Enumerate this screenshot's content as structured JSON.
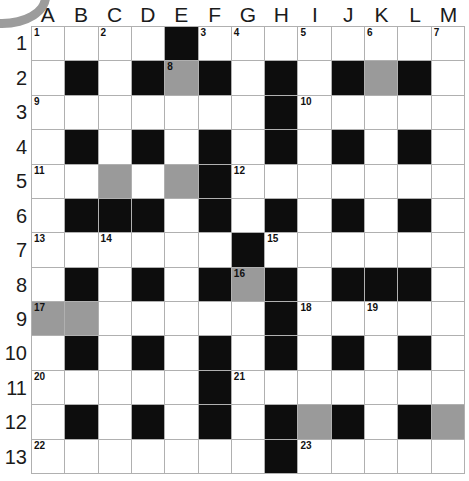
{
  "puzzle": {
    "title": "Crossword Grid",
    "columns": 13,
    "rows": 13,
    "column_headers": [
      "A",
      "B",
      "C",
      "D",
      "E",
      "F",
      "G",
      "H",
      "I",
      "J",
      "K",
      "L",
      "M"
    ],
    "row_headers": [
      "1",
      "2",
      "3",
      "4",
      "5",
      "6",
      "7",
      "8",
      "9",
      "10",
      "11",
      "12",
      "13"
    ],
    "colors": {
      "white_cell": "#ffffff",
      "black_cell": "#0d0d0d",
      "gray_cell": "#9a9a9a",
      "grid_line": "#b0b0b0",
      "text": "#1b1b1b",
      "corner_arc": "#9c9c9c"
    },
    "legend": {
      "white": "open answer cell",
      "black": "blocked cell",
      "gray": "highlighted answer cell"
    },
    "clue_number_count": 23,
    "cells": [
      [
        {
          "state": "white",
          "num": "1"
        },
        {
          "state": "white",
          "num": ""
        },
        {
          "state": "white",
          "num": "2"
        },
        {
          "state": "white",
          "num": ""
        },
        {
          "state": "black",
          "num": ""
        },
        {
          "state": "white",
          "num": "3"
        },
        {
          "state": "white",
          "num": "4"
        },
        {
          "state": "white",
          "num": ""
        },
        {
          "state": "white",
          "num": "5"
        },
        {
          "state": "white",
          "num": ""
        },
        {
          "state": "white",
          "num": "6"
        },
        {
          "state": "white",
          "num": ""
        },
        {
          "state": "white",
          "num": "7"
        }
      ],
      [
        {
          "state": "white",
          "num": ""
        },
        {
          "state": "black",
          "num": ""
        },
        {
          "state": "white",
          "num": ""
        },
        {
          "state": "black",
          "num": ""
        },
        {
          "state": "gray",
          "num": "8"
        },
        {
          "state": "black",
          "num": ""
        },
        {
          "state": "white",
          "num": ""
        },
        {
          "state": "black",
          "num": ""
        },
        {
          "state": "white",
          "num": ""
        },
        {
          "state": "black",
          "num": ""
        },
        {
          "state": "gray",
          "num": ""
        },
        {
          "state": "black",
          "num": ""
        },
        {
          "state": "white",
          "num": ""
        }
      ],
      [
        {
          "state": "white",
          "num": "9"
        },
        {
          "state": "white",
          "num": ""
        },
        {
          "state": "white",
          "num": ""
        },
        {
          "state": "white",
          "num": ""
        },
        {
          "state": "white",
          "num": ""
        },
        {
          "state": "white",
          "num": ""
        },
        {
          "state": "white",
          "num": ""
        },
        {
          "state": "black",
          "num": ""
        },
        {
          "state": "white",
          "num": "10"
        },
        {
          "state": "white",
          "num": ""
        },
        {
          "state": "white",
          "num": ""
        },
        {
          "state": "white",
          "num": ""
        },
        {
          "state": "white",
          "num": ""
        }
      ],
      [
        {
          "state": "white",
          "num": ""
        },
        {
          "state": "black",
          "num": ""
        },
        {
          "state": "white",
          "num": ""
        },
        {
          "state": "black",
          "num": ""
        },
        {
          "state": "white",
          "num": ""
        },
        {
          "state": "black",
          "num": ""
        },
        {
          "state": "white",
          "num": ""
        },
        {
          "state": "black",
          "num": ""
        },
        {
          "state": "white",
          "num": ""
        },
        {
          "state": "black",
          "num": ""
        },
        {
          "state": "white",
          "num": ""
        },
        {
          "state": "black",
          "num": ""
        },
        {
          "state": "white",
          "num": ""
        }
      ],
      [
        {
          "state": "white",
          "num": "11"
        },
        {
          "state": "white",
          "num": ""
        },
        {
          "state": "gray",
          "num": ""
        },
        {
          "state": "white",
          "num": ""
        },
        {
          "state": "gray",
          "num": ""
        },
        {
          "state": "black",
          "num": ""
        },
        {
          "state": "white",
          "num": "12"
        },
        {
          "state": "white",
          "num": ""
        },
        {
          "state": "white",
          "num": ""
        },
        {
          "state": "white",
          "num": ""
        },
        {
          "state": "white",
          "num": ""
        },
        {
          "state": "white",
          "num": ""
        },
        {
          "state": "white",
          "num": ""
        }
      ],
      [
        {
          "state": "white",
          "num": ""
        },
        {
          "state": "black",
          "num": ""
        },
        {
          "state": "black",
          "num": ""
        },
        {
          "state": "black",
          "num": ""
        },
        {
          "state": "white",
          "num": ""
        },
        {
          "state": "black",
          "num": ""
        },
        {
          "state": "white",
          "num": ""
        },
        {
          "state": "black",
          "num": ""
        },
        {
          "state": "white",
          "num": ""
        },
        {
          "state": "black",
          "num": ""
        },
        {
          "state": "white",
          "num": ""
        },
        {
          "state": "black",
          "num": ""
        },
        {
          "state": "white",
          "num": ""
        }
      ],
      [
        {
          "state": "white",
          "num": "13"
        },
        {
          "state": "white",
          "num": ""
        },
        {
          "state": "white",
          "num": "14"
        },
        {
          "state": "white",
          "num": ""
        },
        {
          "state": "white",
          "num": ""
        },
        {
          "state": "white",
          "num": ""
        },
        {
          "state": "black",
          "num": ""
        },
        {
          "state": "white",
          "num": "15"
        },
        {
          "state": "white",
          "num": ""
        },
        {
          "state": "white",
          "num": ""
        },
        {
          "state": "white",
          "num": ""
        },
        {
          "state": "white",
          "num": ""
        },
        {
          "state": "white",
          "num": ""
        }
      ],
      [
        {
          "state": "white",
          "num": ""
        },
        {
          "state": "black",
          "num": ""
        },
        {
          "state": "white",
          "num": ""
        },
        {
          "state": "black",
          "num": ""
        },
        {
          "state": "white",
          "num": ""
        },
        {
          "state": "black",
          "num": ""
        },
        {
          "state": "gray",
          "num": "16"
        },
        {
          "state": "black",
          "num": ""
        },
        {
          "state": "white",
          "num": ""
        },
        {
          "state": "black",
          "num": ""
        },
        {
          "state": "black",
          "num": ""
        },
        {
          "state": "black",
          "num": ""
        },
        {
          "state": "white",
          "num": ""
        }
      ],
      [
        {
          "state": "gray",
          "num": "17"
        },
        {
          "state": "gray",
          "num": ""
        },
        {
          "state": "white",
          "num": ""
        },
        {
          "state": "white",
          "num": ""
        },
        {
          "state": "white",
          "num": ""
        },
        {
          "state": "white",
          "num": ""
        },
        {
          "state": "white",
          "num": ""
        },
        {
          "state": "black",
          "num": ""
        },
        {
          "state": "white",
          "num": "18"
        },
        {
          "state": "white",
          "num": ""
        },
        {
          "state": "white",
          "num": "19"
        },
        {
          "state": "white",
          "num": ""
        },
        {
          "state": "white",
          "num": ""
        }
      ],
      [
        {
          "state": "white",
          "num": ""
        },
        {
          "state": "black",
          "num": ""
        },
        {
          "state": "white",
          "num": ""
        },
        {
          "state": "black",
          "num": ""
        },
        {
          "state": "white",
          "num": ""
        },
        {
          "state": "black",
          "num": ""
        },
        {
          "state": "white",
          "num": ""
        },
        {
          "state": "black",
          "num": ""
        },
        {
          "state": "white",
          "num": ""
        },
        {
          "state": "black",
          "num": ""
        },
        {
          "state": "white",
          "num": ""
        },
        {
          "state": "black",
          "num": ""
        },
        {
          "state": "white",
          "num": ""
        }
      ],
      [
        {
          "state": "white",
          "num": "20"
        },
        {
          "state": "white",
          "num": ""
        },
        {
          "state": "white",
          "num": ""
        },
        {
          "state": "white",
          "num": ""
        },
        {
          "state": "white",
          "num": ""
        },
        {
          "state": "black",
          "num": ""
        },
        {
          "state": "white",
          "num": "21"
        },
        {
          "state": "white",
          "num": ""
        },
        {
          "state": "white",
          "num": ""
        },
        {
          "state": "white",
          "num": ""
        },
        {
          "state": "white",
          "num": ""
        },
        {
          "state": "white",
          "num": ""
        },
        {
          "state": "white",
          "num": ""
        }
      ],
      [
        {
          "state": "white",
          "num": ""
        },
        {
          "state": "black",
          "num": ""
        },
        {
          "state": "white",
          "num": ""
        },
        {
          "state": "black",
          "num": ""
        },
        {
          "state": "white",
          "num": ""
        },
        {
          "state": "black",
          "num": ""
        },
        {
          "state": "white",
          "num": ""
        },
        {
          "state": "black",
          "num": ""
        },
        {
          "state": "gray",
          "num": ""
        },
        {
          "state": "black",
          "num": ""
        },
        {
          "state": "white",
          "num": ""
        },
        {
          "state": "black",
          "num": ""
        },
        {
          "state": "gray",
          "num": ""
        }
      ],
      [
        {
          "state": "white",
          "num": "22"
        },
        {
          "state": "white",
          "num": ""
        },
        {
          "state": "white",
          "num": ""
        },
        {
          "state": "white",
          "num": ""
        },
        {
          "state": "white",
          "num": ""
        },
        {
          "state": "white",
          "num": ""
        },
        {
          "state": "white",
          "num": ""
        },
        {
          "state": "black",
          "num": ""
        },
        {
          "state": "white",
          "num": "23"
        },
        {
          "state": "white",
          "num": ""
        },
        {
          "state": "white",
          "num": ""
        },
        {
          "state": "white",
          "num": ""
        },
        {
          "state": "white",
          "num": ""
        }
      ]
    ]
  }
}
